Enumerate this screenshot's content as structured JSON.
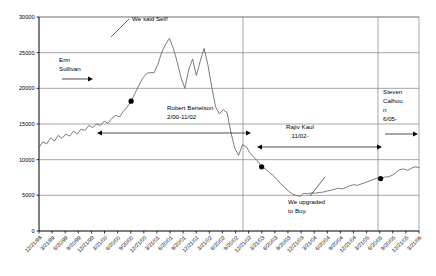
{
  "chart_data": {
    "type": "line",
    "title": "",
    "subtitle": "",
    "xlabel": "",
    "ylabel": "",
    "ylim": [
      0,
      30000
    ],
    "yticks": [
      0,
      5000,
      10000,
      15000,
      20000,
      25000,
      30000
    ],
    "ytick_labels": [
      "0",
      "5000",
      "10000",
      "15000",
      "20000",
      "25000",
      "30000"
    ],
    "grid": "horizontal-and-vertical",
    "legend": "none",
    "xtick_labels": [
      "12/21/98",
      "3/21/99",
      "6/20/99",
      "9/20/99",
      "12/21/99",
      "3/21/00",
      "6/20/00",
      "9/20/00",
      "12/21/00",
      "3/21/01",
      "6/20/01",
      "9/20/01",
      "12/21/01",
      "3/21/02",
      "6/20/02",
      "9/20/02",
      "12/21/02",
      "3/21/03",
      "6/20/03",
      "9/20/03",
      "12/21/03",
      "3/21/04",
      "6/20/04",
      "9/20/04",
      "12/21/04",
      "3/21/05",
      "6/20/05",
      "9/20/05",
      "12/21/05",
      "3/21/06"
    ],
    "series": [
      {
        "name": "Index",
        "values": [
          11700,
          12500,
          12200,
          13050,
          12600,
          13400,
          13000,
          13600,
          13300,
          14000,
          13600,
          14300,
          14100,
          14800,
          14500,
          15000,
          14800,
          15400,
          15100,
          15800,
          16200,
          16000,
          16800,
          17400,
          18200,
          19300,
          20400,
          21400,
          22100,
          22200,
          22200,
          23400,
          25100,
          26200,
          27000,
          25600,
          23700,
          21500,
          20000,
          22600,
          24100,
          21800,
          23800,
          25600,
          23300,
          20200,
          17400,
          16400,
          17000,
          16600,
          13800,
          11600,
          10600,
          12100,
          11800,
          10900,
          10300,
          9800,
          9000,
          8700,
          8200,
          7800,
          7200,
          6600,
          6100,
          5600,
          5200,
          5000,
          4850,
          5300,
          5200,
          5350,
          5300,
          5400,
          5450,
          5600,
          5700,
          5850,
          6000,
          5900,
          6100,
          6350,
          6500,
          6400,
          6600,
          6800,
          7000,
          7200,
          7400,
          7350,
          7550,
          7600,
          7800,
          8200,
          8600,
          8700,
          8500,
          8800,
          9000,
          8900
        ]
      }
    ],
    "markers": [
      {
        "label": "sell-point",
        "x_label": "9/20/00",
        "value": 27000
      },
      {
        "label": "low-point",
        "x_label": "3/21/03",
        "value": 4850
      },
      {
        "label": "upgrade-point",
        "x_label": "6/20/05",
        "value": 7600
      }
    ],
    "annotations": [
      {
        "name": "we-said-sell",
        "text": "We said Sell!"
      },
      {
        "name": "erin-sullivan",
        "line1": "Erin",
        "line2": "Sullivan"
      },
      {
        "name": "robert-bertelson",
        "line1": "Robert Bertelson",
        "line2": "2/00-11/02"
      },
      {
        "name": "rajiv-kaul",
        "line1": "Rajiv Kaul",
        "line2": "11/02-"
      },
      {
        "name": "steven-calhoun",
        "line1": "Steven",
        "line2": "Calhou",
        "line3": "n",
        "line4": "6/05-"
      },
      {
        "name": "we-upgraded",
        "line1": "We upgraded",
        "line2": "to Buy."
      }
    ],
    "colors": {
      "series": "#595959",
      "grid": "#808080",
      "axis": "#000000",
      "marker": "#000000",
      "background": "#ffffff"
    }
  }
}
